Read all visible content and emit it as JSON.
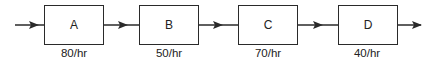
{
  "diagram": {
    "type": "process flow",
    "stations": [
      {
        "label": "A",
        "rate": "80/hr"
      },
      {
        "label": "B",
        "rate": "50/hr"
      },
      {
        "label": "C",
        "rate": "70/hr"
      },
      {
        "label": "D",
        "rate": "40/hr"
      }
    ],
    "colors": {
      "line": "#2a2a2a",
      "text": "#222222"
    }
  }
}
